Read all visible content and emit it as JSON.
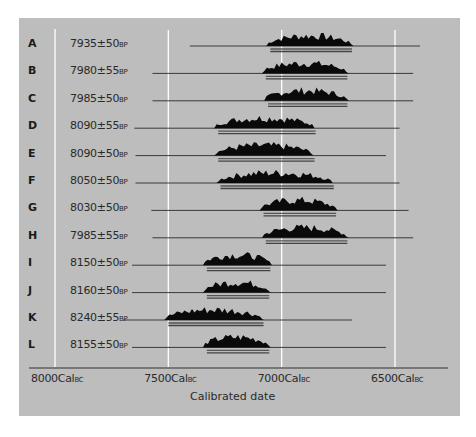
{
  "chart_data": {
    "type": "area",
    "title": "",
    "xlabel": "Calibrated date",
    "ylabel": "",
    "x_axis": {
      "ticks": [
        {
          "value": 8000,
          "label": "8000",
          "unit": "Cal",
          "suffix": "BC"
        },
        {
          "value": 7500,
          "label": "7500",
          "unit": "Cal",
          "suffix": "BC"
        },
        {
          "value": 7000,
          "label": "7000",
          "unit": "Cal",
          "suffix": "BC"
        },
        {
          "value": 6500,
          "label": "6500",
          "unit": "Cal",
          "suffix": "BC"
        }
      ],
      "range": [
        8050,
        6350
      ],
      "direction": "descending (BC)"
    },
    "grid": true,
    "series": [
      {
        "id": "A",
        "date": "7935±50",
        "unit": "BP",
        "bp": 7935,
        "err": 50,
        "line": [
          7405,
          6390
        ],
        "range_95": [
          7050,
          6690
        ]
      },
      {
        "id": "B",
        "date": "7980±55",
        "unit": "BP",
        "bp": 7980,
        "err": 55,
        "line": [
          7570,
          6420
        ],
        "range_95": [
          7070,
          6710
        ]
      },
      {
        "id": "C",
        "date": "7985±50",
        "unit": "BP",
        "bp": 7985,
        "err": 50,
        "line": [
          7570,
          6420
        ],
        "range_95": [
          7060,
          6710
        ]
      },
      {
        "id": "D",
        "date": "8090±55",
        "unit": "BP",
        "bp": 8090,
        "err": 55,
        "line": [
          7650,
          6480
        ],
        "range_95": [
          7280,
          6850
        ]
      },
      {
        "id": "E",
        "date": "8090±50",
        "unit": "BP",
        "bp": 8090,
        "err": 50,
        "line": [
          7645,
          6540
        ],
        "range_95": [
          7280,
          6855
        ]
      },
      {
        "id": "F",
        "date": "8050±50",
        "unit": "BP",
        "bp": 8050,
        "err": 50,
        "line": [
          7645,
          6480
        ],
        "range_95": [
          7270,
          6770
        ]
      },
      {
        "id": "G",
        "date": "8030±50",
        "unit": "BP",
        "bp": 8030,
        "err": 50,
        "line": [
          7575,
          6440
        ],
        "range_95": [
          7080,
          6760
        ]
      },
      {
        "id": "H",
        "date": "7985±55",
        "unit": "BP",
        "bp": 7985,
        "err": 55,
        "line": [
          7570,
          6420
        ],
        "range_95": [
          7070,
          6710
        ]
      },
      {
        "id": "I",
        "date": "8150±50",
        "unit": "BP",
        "bp": 8150,
        "err": 50,
        "line": [
          7660,
          6540
        ],
        "range_95": [
          7330,
          7050
        ]
      },
      {
        "id": "J",
        "date": "8160±50",
        "unit": "BP",
        "bp": 8160,
        "err": 50,
        "line": [
          7660,
          6540
        ],
        "range_95": [
          7330,
          7055
        ]
      },
      {
        "id": "K",
        "date": "8240±55",
        "unit": "BP",
        "bp": 8240,
        "err": 55,
        "line": [
          7700,
          6690
        ],
        "range_95": [
          7500,
          7080
        ]
      },
      {
        "id": "L",
        "date": "8155±50",
        "unit": "BP",
        "bp": 8155,
        "err": 50,
        "line": [
          7660,
          6540
        ],
        "range_95": [
          7330,
          7055
        ]
      }
    ],
    "colors": {
      "panel": "#bdbdbd",
      "distribution": "#000000",
      "gridline": "#ffffff",
      "baseline": "#3a3a3a"
    }
  }
}
